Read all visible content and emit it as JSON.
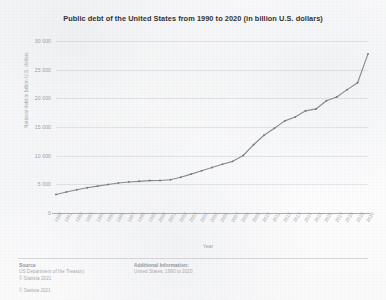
{
  "chart_data": {
    "type": "line",
    "title": "Public debt of the United States from 1990 to 2020 (in billion U.S. dollars)",
    "xlabel": "Year",
    "ylabel": "National debt in billion U.S. dollars",
    "ylim": [
      0,
      30000
    ],
    "yticks": [
      0,
      5000,
      10000,
      15000,
      20000,
      25000,
      30000
    ],
    "ytick_labels": [
      "0",
      "5 000",
      "10 000",
      "15 000",
      "20 000",
      "25 000",
      "30 000"
    ],
    "grid": true,
    "legend": "none",
    "categories": [
      "1990",
      "1991",
      "1992",
      "1993",
      "1994",
      "1995",
      "1996",
      "1997",
      "1998",
      "1999",
      "2000",
      "2001",
      "2002",
      "2003",
      "2004",
      "2005",
      "2006",
      "2007",
      "2008",
      "2009",
      "2010",
      "2011",
      "2012",
      "2013",
      "2014",
      "2015",
      "2016",
      "2017",
      "2018",
      "2019",
      "2020"
    ],
    "values": [
      3233,
      3665,
      4065,
      4411,
      4693,
      4974,
      5225,
      5413,
      5526,
      5656,
      5674,
      5807,
      6228,
      6783,
      7379,
      7933,
      8507,
      9008,
      10025,
      11910,
      13562,
      14790,
      16066,
      16738,
      17824,
      18151,
      19573,
      20245,
      21516,
      22719,
      27748
    ],
    "series_color": "#7f8287"
  },
  "footer": {
    "source_heading": "Source",
    "source_lines": [
      "US Department of the Treasury",
      "© Statista 2021"
    ],
    "additional_heading": "Additional Information:",
    "additional_lines": [
      "United States; 1990 to 2020"
    ]
  },
  "copyright": "© Statista 2021"
}
